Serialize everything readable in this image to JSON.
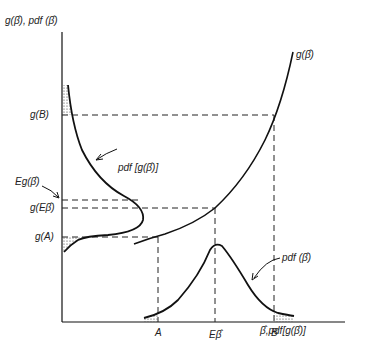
{
  "diagram": {
    "y_axis_label": "g(β̂), pdf (β̂)",
    "x_axis_label": "β̂,pdf[g(β̂)]",
    "curve_g_label": "g(β̂)",
    "pdf_g_label": "pdf [g(β̂)]",
    "pdf_beta_label": "pdf (β̂)",
    "y_ticks": {
      "gB": "g(B)",
      "Eg": "Eg(β̂)",
      "gEb": "g(Eβ̂)",
      "gA": "g(A)"
    },
    "x_ticks": {
      "A": "A",
      "Eb": "Eβ̂",
      "B": "B"
    },
    "colors": {
      "ink": "#111111",
      "background": "#ffffff"
    }
  }
}
